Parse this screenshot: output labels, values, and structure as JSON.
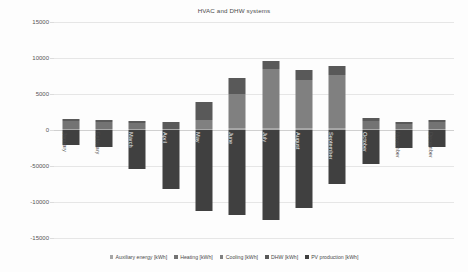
{
  "chart_data": {
    "type": "bar",
    "title": "HVAC and DHW systems",
    "xlabel": "",
    "ylabel": "",
    "ylim": [
      -15000,
      15000
    ],
    "grid": true,
    "legend_position": "bottom",
    "stacked": true,
    "categories": [
      "January",
      "February",
      "March",
      "April",
      "May",
      "June",
      "July",
      "August",
      "September",
      "October",
      "November",
      "December"
    ],
    "ytick_labels": [
      "15000",
      "10000",
      "5000",
      "0",
      "-50000",
      "-10000",
      "-15000"
    ],
    "ytick_values": [
      15000,
      10000,
      5000,
      0,
      -5000,
      -10000,
      -15000
    ],
    "series": [
      {
        "name": "Auxiliary energy [kWh]",
        "color": "#a6a6a6",
        "values": [
          150,
          140,
          120,
          110,
          180,
          230,
          280,
          260,
          230,
          160,
          120,
          140
        ]
      },
      {
        "name": "Heating [kWh]",
        "color": "#737373",
        "values": [
          1100,
          980,
          820,
          0,
          0,
          0,
          0,
          0,
          0,
          1050,
          760,
          960
        ]
      },
      {
        "name": "Cooling [kWh]",
        "color": "#808080",
        "values": [
          0,
          0,
          0,
          0,
          1200,
          4800,
          8200,
          6700,
          7400,
          0,
          0,
          0
        ]
      },
      {
        "name": "DHW [kWh]",
        "color": "#595959",
        "values": [
          330,
          320,
          290,
          1000,
          2500,
          2150,
          1100,
          1400,
          1250,
          400,
          270,
          300
        ]
      },
      {
        "name": "PV production [kWh]",
        "color": "#404040",
        "values": [
          -2050,
          -2350,
          -5450,
          -8250,
          -11300,
          -11750,
          -12500,
          -10850,
          -7500,
          -4750,
          -2450,
          -2300
        ]
      }
    ]
  },
  "legend": {
    "items": [
      {
        "label": "Auxiliary energy [kWh]"
      },
      {
        "label": "Heating [kWh]"
      },
      {
        "label": "Cooling [kWh]"
      },
      {
        "label": "DHW [kWh]"
      },
      {
        "label": "PV production [kWh]"
      }
    ]
  }
}
